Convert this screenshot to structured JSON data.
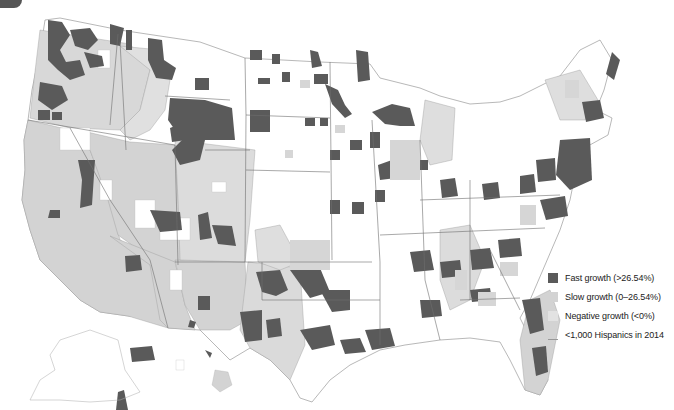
{
  "map": {
    "subject": "Change in Hispanic population by U.S. county",
    "colors": {
      "fast": "#5a5a5a",
      "slow": "#d3d3d3",
      "negative": "#e2e2e2",
      "none": "#ffffff",
      "border": "#777777",
      "county_line": "#b8b8b8"
    }
  },
  "legend": {
    "items": [
      {
        "key": "fast",
        "label": "Fast growth (>26.54%)",
        "color": "#5a5a5a"
      },
      {
        "key": "slow",
        "label": "Slow growth (0–26.54%)",
        "color": "#d3d3d3"
      },
      {
        "key": "negative",
        "label": "Negative growth (<0%)",
        "color": "#e2e2e2"
      },
      {
        "key": "none",
        "label": "<1,000 Hispanics in 2014",
        "color": "#ffffff"
      }
    ]
  }
}
